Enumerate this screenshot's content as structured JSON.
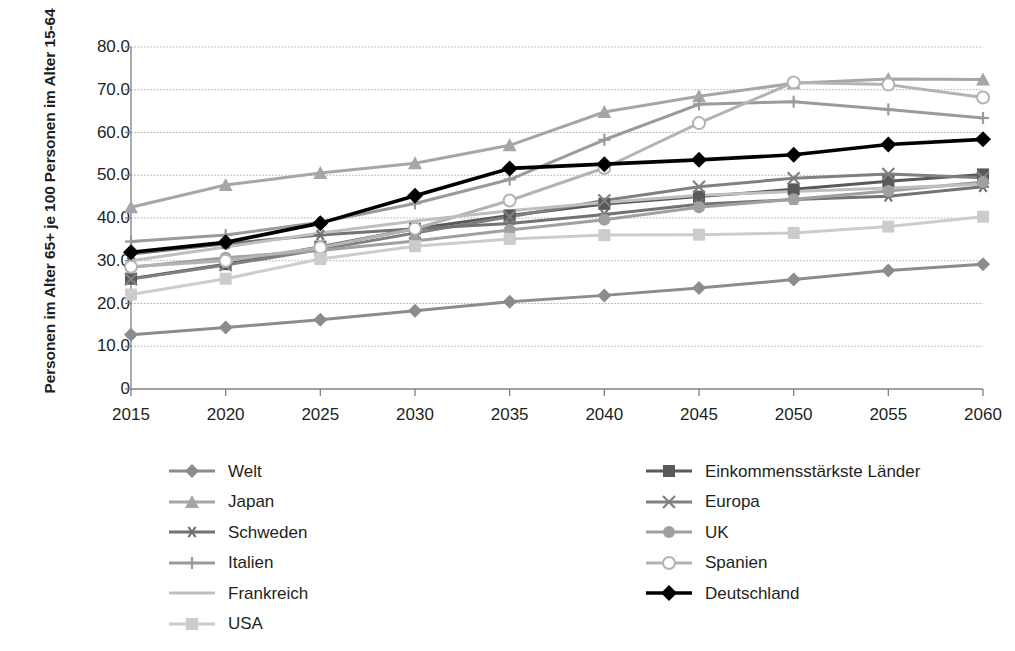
{
  "chart_data": {
    "type": "line",
    "title": "",
    "xlabel": "",
    "ylabel": "Personen im Alter 65+ je 100 Personen im Alter 15-64",
    "categories": [
      "2015",
      "2020",
      "2025",
      "2030",
      "2035",
      "2040",
      "2045",
      "2050",
      "2055",
      "2060"
    ],
    "x": [
      2015,
      2020,
      2025,
      2030,
      2035,
      2040,
      2045,
      2050,
      2055,
      2060
    ],
    "ylim": [
      0,
      80
    ],
    "yticks": [
      "0",
      "10.0",
      "20.0",
      "30.0",
      "40.0",
      "50.0",
      "60.0",
      "70.0",
      "80.0"
    ],
    "ytick_values": [
      0,
      10,
      20,
      30,
      40,
      50,
      60,
      70,
      80
    ],
    "grid": true,
    "legend_position": "bottom",
    "series": [
      {
        "name": "Welt",
        "marker": "diamond",
        "color": "#8c8c8c",
        "values": [
          12.7,
          14.4,
          16.2,
          18.3,
          20.4,
          21.9,
          23.6,
          25.6,
          27.7,
          29.2
        ]
      },
      {
        "name": "Einkommensstärkste Länder",
        "marker": "square",
        "color": "#595959",
        "values": [
          25.8,
          29.2,
          33.3,
          37.5,
          40.6,
          43.3,
          45.0,
          46.7,
          48.6,
          50.2
        ]
      },
      {
        "name": "Japan",
        "marker": "triangle",
        "color": "#a6a6a6",
        "values": [
          42.5,
          47.7,
          50.5,
          52.8,
          57.0,
          64.8,
          68.5,
          71.5,
          72.5,
          72.4
        ]
      },
      {
        "name": "Europa",
        "marker": "cross",
        "color": "#808080",
        "values": [
          25.7,
          29.0,
          32.6,
          36.5,
          40.3,
          44.1,
          47.3,
          49.3,
          50.3,
          49.4
        ]
      },
      {
        "name": "Schweden",
        "marker": "asterisk",
        "color": "#737373",
        "values": [
          31.6,
          34.0,
          36.0,
          37.5,
          38.7,
          40.8,
          43.2,
          44.3,
          45.1,
          47.3
        ]
      },
      {
        "name": "UK",
        "marker": "circle",
        "color": "#a0a0a0",
        "values": [
          28.5,
          30.7,
          32.4,
          34.6,
          37.2,
          39.6,
          42.5,
          44.4,
          46.3,
          48.4
        ]
      },
      {
        "name": "Italien",
        "marker": "plus",
        "color": "#9a9a9a",
        "values": [
          34.5,
          36.0,
          39.0,
          43.4,
          49.0,
          58.3,
          66.6,
          67.2,
          65.4,
          63.4
        ]
      },
      {
        "name": "Spanien",
        "marker": "open-circle",
        "color": "#b3b3b3",
        "values": [
          28.6,
          30.0,
          33.1,
          37.5,
          44.1,
          51.7,
          62.2,
          71.7,
          71.2,
          68.2
        ]
      },
      {
        "name": "Frankreich",
        "marker": "none",
        "color": "#bfbfbf",
        "values": [
          30.0,
          33.2,
          36.5,
          39.3,
          41.7,
          43.6,
          45.3,
          46.2,
          47.0,
          47.9
        ]
      },
      {
        "name": "Deutschland",
        "marker": "diamond",
        "color": "#000000",
        "values": [
          32.0,
          34.3,
          38.8,
          45.2,
          51.6,
          52.6,
          53.6,
          54.8,
          57.2,
          58.4
        ]
      },
      {
        "name": "USA",
        "marker": "square",
        "color": "#cccccc",
        "values": [
          22.1,
          25.8,
          30.4,
          33.4,
          35.1,
          36.0,
          36.1,
          36.5,
          38.0,
          40.3
        ]
      }
    ]
  },
  "legend": {
    "left_column": [
      {
        "label": "Welt",
        "series": "Welt"
      },
      {
        "label": "Japan",
        "series": "Japan"
      },
      {
        "label": "Schweden",
        "series": "Schweden"
      },
      {
        "label": "Italien",
        "series": "Italien"
      },
      {
        "label": "Frankreich",
        "series": "Frankreich"
      },
      {
        "label": "USA",
        "series": "USA"
      }
    ],
    "right_column": [
      {
        "label": "Einkommensstärkste Länder",
        "series": "Einkommensstärkste Länder"
      },
      {
        "label": "Europa",
        "series": "Europa"
      },
      {
        "label": "UK",
        "series": "UK"
      },
      {
        "label": "Spanien",
        "series": "Spanien"
      },
      {
        "label": "Deutschland",
        "series": "Deutschland"
      }
    ]
  },
  "axes": {
    "y_title": "Personen im Alter 65+ je 100 Personen im Alter 15-64"
  }
}
